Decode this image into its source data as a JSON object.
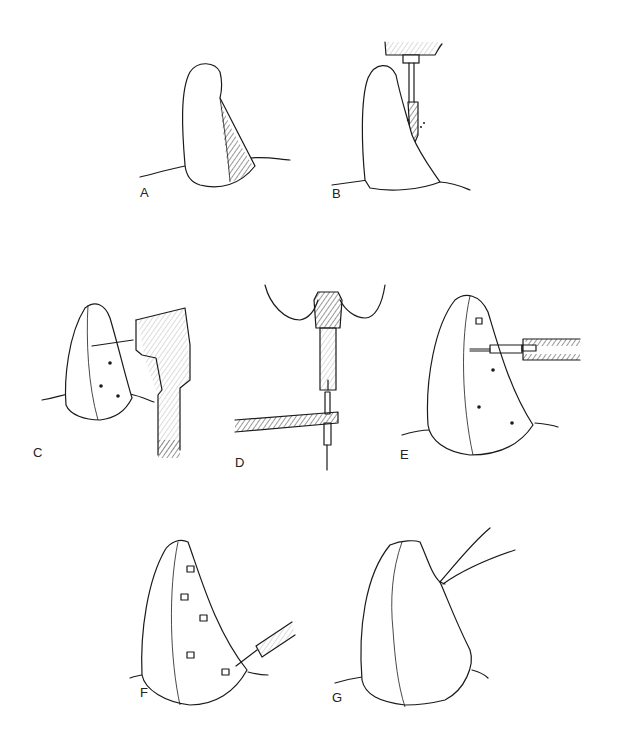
{
  "figure": {
    "type": "multi-panel line illustration",
    "panels": [
      {
        "id": "A",
        "label": "A",
        "description": "tooth with hatched (shaded) lateral surface region"
      },
      {
        "id": "B",
        "label": "B",
        "description": "bur/drill cutting along the tooth surface"
      },
      {
        "id": "C",
        "label": "C",
        "description": "handpiece drilling pin holes in tooth, three holes shown"
      },
      {
        "id": "D",
        "label": "D",
        "description": "pin being inserted into chuck/driver with tweezers"
      },
      {
        "id": "E",
        "label": "E",
        "description": "pin inserted into tooth with driver, one pin and three holes"
      },
      {
        "id": "F",
        "label": "F",
        "description": "multiple pins placed, last pin being set with driver"
      },
      {
        "id": "G",
        "label": "G",
        "description": "restoration material built up over pins, instrument contouring"
      }
    ]
  }
}
